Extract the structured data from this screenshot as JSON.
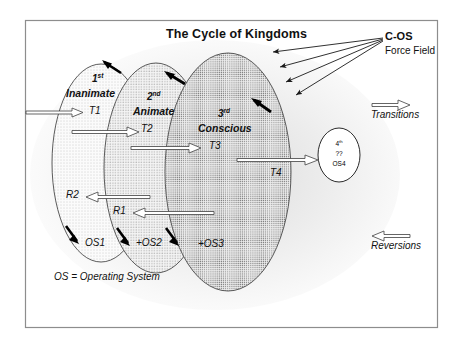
{
  "diagram": {
    "title": "The Cycle of Kingdoms",
    "legend_note": "OS = Operating System",
    "force_field": {
      "label": "C-OS",
      "sublabel": "Force Field"
    },
    "legend": {
      "transitions": "Transitions",
      "reversions": "Reversions"
    },
    "kingdoms": [
      {
        "ordinal": "1",
        "ordinal_suffix": "st",
        "name": "Inanimate",
        "transition": "T1",
        "os": "OS1"
      },
      {
        "ordinal": "2",
        "ordinal_suffix": "nd",
        "name": "Animate",
        "transition": "T2",
        "os": "+OS2"
      },
      {
        "ordinal": "3",
        "ordinal_suffix": "rd",
        "name": "Conscious",
        "transition": "T3",
        "os": "+OS3"
      }
    ],
    "fourth": {
      "ordinal": "4",
      "ordinal_suffix": "th",
      "unknown": "??",
      "os": "OS4"
    },
    "transition_t4": "T4",
    "reversions": [
      {
        "label": "R1"
      },
      {
        "label": "R2"
      }
    ],
    "colors": {
      "ink": "#111111",
      "border": "#8d8d8d",
      "ellipse_stroke": "#3a3a3a",
      "fill_1": "#f2f2f2",
      "fill_2": "#e2e2e2",
      "fill_3": "#cfcfcf",
      "arrow_outline": "#4a4a4a",
      "arrow_solid": "#000000"
    }
  }
}
